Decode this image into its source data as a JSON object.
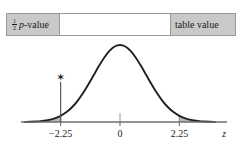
{
  "figure": {
    "annotation_bar": {
      "left_cell": {
        "fraction_numerator": "1",
        "fraction_denominator": "2",
        "text_italic": "p",
        "text_rest": "-value"
      },
      "middle_cell": {
        "text": ""
      },
      "right_cell": {
        "text": "table value"
      }
    },
    "marker": {
      "symbol": "✶",
      "at_z": -2.25
    }
  },
  "chart_data": {
    "type": "area",
    "title": "",
    "subtitle": "",
    "xlabel": "z",
    "ylabel": "",
    "grid": false,
    "legend": null,
    "curve": "standard normal density",
    "xlim": [
      -3.6,
      3.6
    ],
    "ylim": [
      0,
      0.42
    ],
    "tick_labels": [
      "−2.25",
      "0",
      "2.25"
    ],
    "tick_values": [
      -2.25,
      0,
      2.25
    ],
    "axis_label": "z",
    "shaded_regions": [
      {
        "name": "left-tail",
        "from": -3.6,
        "to": -2.25,
        "fill": "#b8b8b8"
      },
      {
        "name": "right-tail",
        "from": 2.25,
        "to": 3.6,
        "fill": "#b8b8b8"
      }
    ],
    "annotations": [
      {
        "text": "✯",
        "x": -2.25,
        "y": 0.175,
        "name": "star-marker"
      }
    ],
    "vertical_lines": [
      -2.25,
      0,
      2.25
    ],
    "x": [
      -3.6,
      -3.4,
      -3.2,
      -3.0,
      -2.8,
      -2.6,
      -2.4,
      -2.25,
      -2.0,
      -1.8,
      -1.6,
      -1.4,
      -1.2,
      -1.0,
      -0.8,
      -0.6,
      -0.4,
      -0.2,
      0,
      0.2,
      0.4,
      0.6,
      0.8,
      1.0,
      1.2,
      1.4,
      1.6,
      1.8,
      2.0,
      2.25,
      2.4,
      2.6,
      2.8,
      3.0,
      3.2,
      3.4,
      3.6
    ],
    "y": [
      0.0006,
      0.0012,
      0.0024,
      0.0044,
      0.0079,
      0.0136,
      0.0224,
      0.0317,
      0.054,
      0.079,
      0.1109,
      0.1497,
      0.1942,
      0.242,
      0.2897,
      0.3332,
      0.3683,
      0.391,
      0.3989,
      0.391,
      0.3683,
      0.3332,
      0.2897,
      0.242,
      0.1942,
      0.1497,
      0.1109,
      0.079,
      0.054,
      0.0317,
      0.0224,
      0.0136,
      0.0079,
      0.0044,
      0.0024,
      0.0012,
      0.0006
    ],
    "colors": {
      "curve": "#231f20",
      "shade": "#b8b8b8",
      "axis": "#6e6e6e",
      "bar_gray": "#c9c9c9"
    }
  }
}
